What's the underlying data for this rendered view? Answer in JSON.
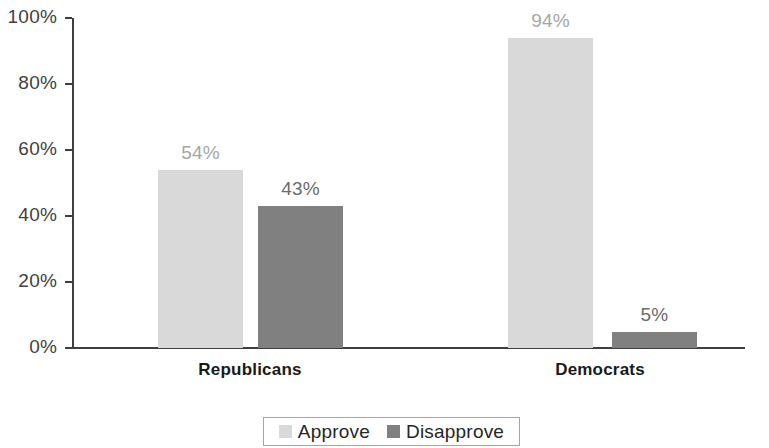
{
  "chart_data": {
    "type": "bar",
    "title": "",
    "subtitle": "",
    "xlabel": "",
    "ylabel": "",
    "categories": [
      "Republicans",
      "Democrats"
    ],
    "series": [
      {
        "name": "Approve",
        "color": "#d9d9d9",
        "values": [
          54,
          94
        ],
        "value_labels": [
          "54%",
          "94%"
        ]
      },
      {
        "name": "Disapprove",
        "color": "#808080",
        "values": [
          43,
          5
        ],
        "value_labels": [
          "43%",
          "5%"
        ]
      }
    ],
    "ylim": [
      0,
      100
    ],
    "ytick_values": [
      0,
      20,
      40,
      60,
      80,
      100
    ],
    "ytick_labels": [
      "0%",
      "20%",
      "40%",
      "60%",
      "80%",
      "100%"
    ],
    "grid": false,
    "legend_position": "bottom",
    "legend_entries": [
      "Approve",
      "Disapprove"
    ]
  },
  "axis": {
    "y_ticks": [
      {
        "label": "100%",
        "value": 100
      },
      {
        "label": "80%",
        "value": 80
      },
      {
        "label": "60%",
        "value": 60
      },
      {
        "label": "40%",
        "value": 40
      },
      {
        "label": "20%",
        "value": 20
      },
      {
        "label": "0%",
        "value": 0
      }
    ]
  },
  "groups": [
    {
      "label": "Republicans",
      "bars": [
        {
          "series": "Approve",
          "value": 54,
          "label": "54%",
          "style": "approve"
        },
        {
          "series": "Disapprove",
          "value": 43,
          "label": "43%",
          "style": "disapprove"
        }
      ]
    },
    {
      "label": "Democrats",
      "bars": [
        {
          "series": "Approve",
          "value": 94,
          "label": "94%",
          "style": "approve"
        },
        {
          "series": "Disapprove",
          "value": 5,
          "label": "5%",
          "style": "disapprove"
        }
      ]
    }
  ],
  "legend": {
    "items": [
      {
        "label": "Approve",
        "style": "approve",
        "color": "#d9d9d9"
      },
      {
        "label": "Disapprove",
        "style": "disapprove",
        "color": "#808080"
      }
    ]
  }
}
